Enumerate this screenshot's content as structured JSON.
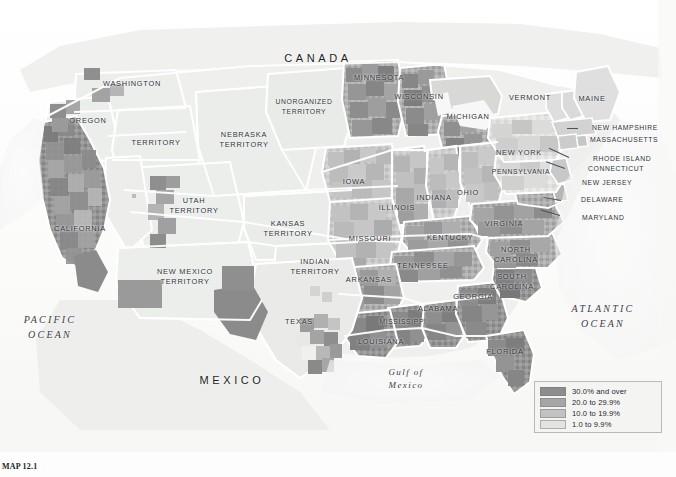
{
  "figure": {
    "caption": "MAP 12.1",
    "background_color": "#fcfcfc"
  },
  "legend": {
    "title": "",
    "entries": [
      {
        "label": "30.0% and over",
        "color": "#8d8d8d"
      },
      {
        "label": "20.0 to 29.9%",
        "color": "#a6a6a6"
      },
      {
        "label": "10.0 to 19.9%",
        "color": "#c2c2c2"
      },
      {
        "label": "1.0 to 9.9%",
        "color": "#e3e3e1"
      }
    ],
    "box_color": "#f4f4f2",
    "border_color": "#b9bbb8"
  },
  "map": {
    "country_labels": [
      {
        "name": "canada",
        "text": "CANADA",
        "x": 318,
        "y": 59
      },
      {
        "name": "mexico",
        "text": "MEXICO",
        "x": 232,
        "y": 381
      }
    ],
    "ocean_labels": [
      {
        "name": "pacific-ocean",
        "line1": "PACIFIC",
        "line2": "OCEAN",
        "x": 50,
        "y": 327
      },
      {
        "name": "atlantic-ocean",
        "line1": "ATLANTIC",
        "line2": "OCEAN",
        "x": 603,
        "y": 316
      },
      {
        "name": "gulf-of-mexico",
        "line1": "Gulf of",
        "line2": "Mexico",
        "x": 406,
        "y": 379
      }
    ],
    "state_labels": [
      {
        "name": "washington-territory",
        "line1": "WASHINGTON",
        "line2": "",
        "x": 132,
        "y": 84
      },
      {
        "name": "oregon",
        "line1": "OREGON",
        "line2": "",
        "x": 88,
        "y": 121
      },
      {
        "name": "territory",
        "line1": "TERRITORY",
        "line2": "",
        "x": 156,
        "y": 143
      },
      {
        "name": "california",
        "line1": "CALIFORNIA",
        "line2": "",
        "x": 80,
        "y": 229
      },
      {
        "name": "utah-territory",
        "line1": "UTAH",
        "line2": "TERRITORY",
        "x": 194,
        "y": 205
      },
      {
        "name": "nebraska-territory",
        "line1": "NEBRASKA",
        "line2": "TERRITORY",
        "x": 244,
        "y": 139
      },
      {
        "name": "kansas-territory",
        "line1": "KANSAS",
        "line2": "TERRITORY",
        "x": 288,
        "y": 228
      },
      {
        "name": "new-mexico-territory",
        "line1": "NEW MEXICO",
        "line2": "TERRITORY",
        "x": 185,
        "y": 276
      },
      {
        "name": "indian-territory",
        "line1": "INDIAN",
        "line2": "TERRITORY",
        "x": 315,
        "y": 266
      },
      {
        "name": "texas",
        "line1": "TEXAS",
        "line2": "",
        "x": 299,
        "y": 322
      },
      {
        "name": "unorganized-territory",
        "line1": "UNORGANIZED",
        "line2": "TERRITORY",
        "x": 304,
        "y": 106
      },
      {
        "name": "minnesota",
        "line1": "MINNESOTA",
        "line2": "",
        "x": 379,
        "y": 78
      },
      {
        "name": "wisconsin",
        "line1": "WISCONSIN",
        "line2": "",
        "x": 419,
        "y": 97
      },
      {
        "name": "michigan",
        "line1": "MICHIGAN",
        "line2": "",
        "x": 468,
        "y": 117
      },
      {
        "name": "iowa",
        "line1": "IOWA",
        "line2": "",
        "x": 354,
        "y": 182
      },
      {
        "name": "illinois",
        "line1": "ILLINOIS",
        "line2": "",
        "x": 397,
        "y": 208
      },
      {
        "name": "indiana",
        "line1": "INDIANA",
        "line2": "",
        "x": 434,
        "y": 198
      },
      {
        "name": "ohio",
        "line1": "OHIO",
        "line2": "",
        "x": 468,
        "y": 193
      },
      {
        "name": "missouri",
        "line1": "MISSOURI",
        "line2": "",
        "x": 370,
        "y": 239
      },
      {
        "name": "kentucky",
        "line1": "KENTUCKY",
        "line2": "",
        "x": 450,
        "y": 238
      },
      {
        "name": "tennessee",
        "line1": "TENNESSEE",
        "line2": "",
        "x": 423,
        "y": 266
      },
      {
        "name": "arkansas",
        "line1": "ARKANSAS",
        "line2": "",
        "x": 369,
        "y": 280
      },
      {
        "name": "mississippi",
        "line1": "MISSISSIPPI",
        "line2": "",
        "x": 403,
        "y": 322
      },
      {
        "name": "louisiana",
        "line1": "LOUISIANA",
        "line2": "",
        "x": 381,
        "y": 342
      },
      {
        "name": "alabama",
        "line1": "ALABAMA",
        "line2": "",
        "x": 438,
        "y": 309
      },
      {
        "name": "georgia",
        "line1": "GEORGIA",
        "line2": "",
        "x": 473,
        "y": 297
      },
      {
        "name": "florida",
        "line1": "FLORIDA",
        "line2": "",
        "x": 505,
        "y": 352
      },
      {
        "name": "south-carolina",
        "line1": "SOUTH",
        "line2": "CAROLINA",
        "x": 512,
        "y": 281
      },
      {
        "name": "north-carolina",
        "line1": "NORTH",
        "line2": "CAROLINA",
        "x": 516,
        "y": 254
      },
      {
        "name": "virginia",
        "line1": "VIRGINIA",
        "line2": "",
        "x": 504,
        "y": 224
      },
      {
        "name": "pennsylvania",
        "line1": "PENNSYLVANIA",
        "line2": "",
        "x": 521,
        "y": 172
      },
      {
        "name": "new-york",
        "line1": "NEW YORK",
        "line2": "",
        "x": 519,
        "y": 153
      },
      {
        "name": "vermont",
        "line1": "VERMONT",
        "line2": "",
        "x": 530,
        "y": 98
      },
      {
        "name": "maine",
        "line1": "MAINE",
        "line2": "",
        "x": 592,
        "y": 99
      }
    ],
    "callout_labels": [
      {
        "name": "new-hampshire",
        "text": "NEW HAMPSHIRE",
        "x": 592,
        "y": 128,
        "leader_x": 578,
        "leader_y": 128,
        "leader_len": 11,
        "leader_angle": 180
      },
      {
        "name": "massachusetts",
        "text": "MASSACHUSETTS",
        "x": 590,
        "y": 140,
        "leader_x": 0,
        "leader_y": 0,
        "leader_len": 0,
        "leader_angle": 0
      },
      {
        "name": "rhode-island",
        "text": "RHODE ISLAND",
        "x": 593,
        "y": 159,
        "leader_x": 569,
        "leader_y": 157,
        "leader_len": 22,
        "leader_angle": 205
      },
      {
        "name": "connecticut",
        "text": "CONNECTICUT",
        "x": 588,
        "y": 169,
        "leader_x": 565,
        "leader_y": 168,
        "leader_len": 20,
        "leader_angle": 200
      },
      {
        "name": "new-jersey",
        "text": "NEW JERSEY",
        "x": 582,
        "y": 183,
        "leader_x": 0,
        "leader_y": 0,
        "leader_len": 0,
        "leader_angle": 0
      },
      {
        "name": "delaware",
        "text": "DELAWARE",
        "x": 581,
        "y": 200,
        "leader_x": 561,
        "leader_y": 200,
        "leader_len": 18,
        "leader_angle": 190
      },
      {
        "name": "maryland",
        "text": "MARYLAND",
        "x": 582,
        "y": 218,
        "leader_x": 560,
        "leader_y": 215,
        "leader_len": 20,
        "leader_angle": 196
      }
    ]
  }
}
